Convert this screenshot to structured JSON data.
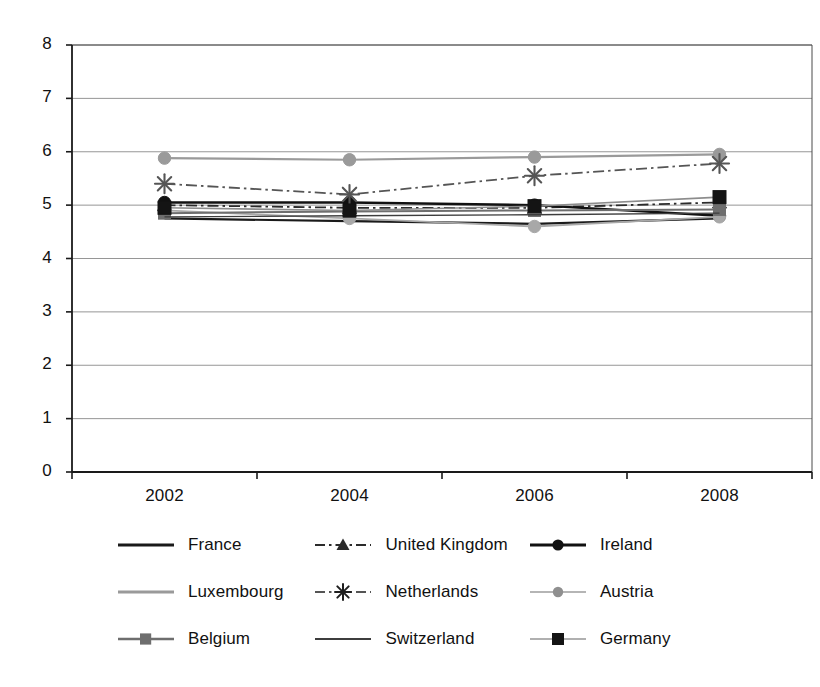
{
  "chart_data": {
    "type": "line",
    "title": "",
    "subtitle": "",
    "xlabel": "",
    "ylabel": "",
    "categories": [
      "2002",
      "2004",
      "2006",
      "2008"
    ],
    "x": [
      2002,
      2004,
      2006,
      2008
    ],
    "ylim": [
      0,
      8
    ],
    "yticks": [
      0,
      1,
      2,
      3,
      4,
      5,
      6,
      7,
      8
    ],
    "ytick_labels": [
      "0",
      "1",
      "2",
      "3",
      "4",
      "5",
      "6",
      "7",
      "8"
    ],
    "xtick_labels": [
      "2002",
      "2004",
      "2006",
      "2008"
    ],
    "grid": "horizontal",
    "legend_position": "bottom",
    "legend_columns": 3,
    "series": [
      {
        "name": "France",
        "values": [
          4.75,
          4.7,
          4.65,
          4.75
        ],
        "color": "#1a1a1a",
        "line_style": "solid",
        "line_width": 2.2,
        "marker": "none"
      },
      {
        "name": "United Kingdom",
        "values": [
          5.0,
          4.95,
          4.95,
          5.05
        ],
        "color": "#2b2b2b",
        "line_style": "dashdot",
        "line_width": 1.8,
        "marker": "triangle"
      },
      {
        "name": "Ireland",
        "values": [
          5.05,
          5.05,
          5.0,
          4.8
        ],
        "color": "#111111",
        "line_style": "solid",
        "line_width": 2.4,
        "marker": "circle"
      },
      {
        "name": "Luxembourg",
        "values": [
          5.88,
          5.85,
          5.9,
          5.95
        ],
        "color": "#9a9a9a",
        "line_style": "solid",
        "line_width": 2.2,
        "marker": "circle"
      },
      {
        "name": "Netherlands",
        "values": [
          5.4,
          5.2,
          5.55,
          5.78
        ],
        "color": "#555555",
        "line_style": "dashdot",
        "line_width": 1.8,
        "marker": "asterisk"
      },
      {
        "name": "Austria",
        "values": [
          4.9,
          4.75,
          4.6,
          4.78
        ],
        "color": "#a8a8a8",
        "line_style": "solid",
        "line_width": 1.8,
        "marker": "circle"
      },
      {
        "name": "Belgium",
        "values": [
          4.85,
          4.88,
          4.9,
          4.92
        ],
        "color": "#6e6e6e",
        "line_style": "solid",
        "line_width": 2.0,
        "marker": "square"
      },
      {
        "name": "Switzerland",
        "values": [
          4.78,
          4.8,
          4.82,
          4.85
        ],
        "color": "#3d3d3d",
        "line_style": "solid",
        "line_width": 1.4,
        "marker": "none"
      },
      {
        "name": "Germany",
        "values": [
          4.95,
          4.9,
          4.98,
          5.15
        ],
        "color": "#8c8c8c",
        "line_style": "solid",
        "line_width": 1.6,
        "marker": "square-dark"
      }
    ]
  },
  "axis": {
    "y_labels": [
      "8",
      "7",
      "6",
      "5",
      "4",
      "3",
      "2",
      "1",
      "0"
    ],
    "x_labels": [
      "2002",
      "2004",
      "2006",
      "2008"
    ]
  },
  "legend": {
    "rows": [
      [
        {
          "label": "France",
          "key": "line-plain-dark"
        },
        {
          "label": "United Kingdom",
          "key": "dashdot-triangle"
        },
        {
          "label": "Ireland",
          "key": "line-circle-dark"
        }
      ],
      [
        {
          "label": "Luxembourg",
          "key": "line-plain-light"
        },
        {
          "label": "Netherlands",
          "key": "dashdot-asterisk"
        },
        {
          "label": "Austria",
          "key": "line-circle-gray"
        }
      ],
      [
        {
          "label": "Belgium",
          "key": "line-square-gray"
        },
        {
          "label": "Switzerland",
          "key": "line-plain-thin"
        },
        {
          "label": "Germany",
          "key": "line-square-dark"
        }
      ]
    ]
  },
  "colors": {
    "axis": "#1a1a1a",
    "grid": "#8a8a8a",
    "background": "#ffffff",
    "text": "#111111"
  }
}
